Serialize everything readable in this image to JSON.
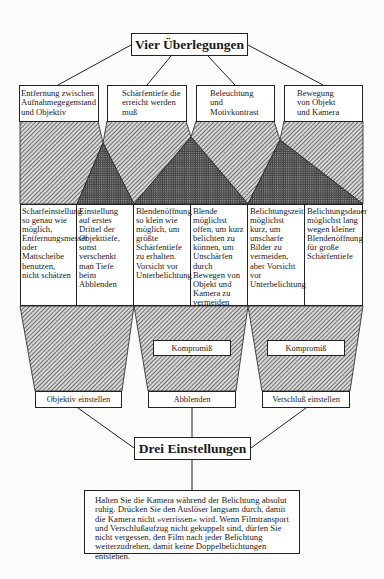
{
  "diagram": {
    "top_title": "Vier Überlegungen",
    "considerations": [
      {
        "label": "Entfernung zwischen Aufnahmegegenstand und Objektiv"
      },
      {
        "label": "Schärfentiefe die erreicht werden muß"
      },
      {
        "label": "Beleuchtung und Motivkontrast"
      },
      {
        "label": "Bewegung von Objekt und Kamera"
      }
    ],
    "columns": [
      {
        "text": "Scharfeinstellung so genau wie möglich, Entfernungsmesser oder Mattscheibe benutzen, nicht schätzen"
      },
      {
        "text": "Einstellung auf erstes Drittel der Objekttiefe, sonst verschenkt man Tiefe beim Abblenden"
      },
      {
        "text": "Blendenöffnung so klein wie möglich, um größte Schärfentiefe zu erhalten. Vorsicht vor Unterbelichtung"
      },
      {
        "text": "Blende möglichst offen, um kurz belichten zu können, um Unschärfen durch Bewegen von Objekt und Kamera zu vermeiden"
      },
      {
        "text": "Belichtungszeit möglichst kurz, um unscharfe Bilder zu vermeiden, aber Vorsicht vor Unterbelichtung"
      },
      {
        "text": "Belichtungsdauer möglichst lang wegen kleiner Blendenöffnung für große Schärfentiefe"
      }
    ],
    "compromise_label": "Kompromiß",
    "settings": [
      {
        "label": "Objektiv einstellen"
      },
      {
        "label": "Abblenden"
      },
      {
        "label": "Verschluß einstellen"
      }
    ],
    "bottom_title": "Drei Einstellungen",
    "note": "Halten Sie die Kamera während der Belichtung absolut ruhig. Drücken Sie den Auslöser langsam durch, damit die Kamera nicht »verrissen« wird. Wenn Filmtransport und Verschlußaufzug nicht gekuppelt sind, dürfen Sie nicht vergessen, den Film nach jeder Belichtung weiterzudrehen, damit keine Doppelbelichtungen entstehen."
  },
  "colors": {
    "line": "#222222",
    "box_fill": "#ffffff",
    "background": "#fbfbf9"
  }
}
